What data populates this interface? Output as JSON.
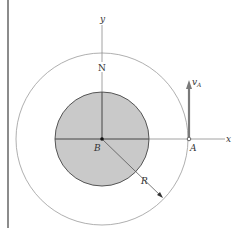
{
  "diagram": {
    "labels": {
      "y_axis": "y",
      "x_axis": "x",
      "north": "N",
      "center": "B",
      "point": "A",
      "radius": "R",
      "velocity_main": "v",
      "velocity_sub": "A"
    },
    "colors": {
      "disk_fill": "#c9c9c9",
      "disk_stroke": "#555555",
      "outer_circle": "#9a9a9a",
      "axis": "#8a8a8a",
      "arrow": "#7a7a7a",
      "side_bar": "#8c8c8c"
    }
  }
}
